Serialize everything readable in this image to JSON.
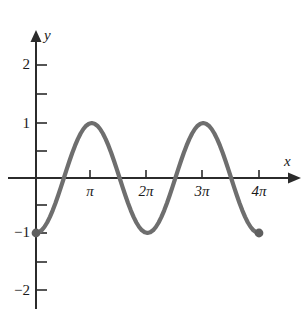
{
  "figure": {
    "background_color": "#ffffff",
    "axis_color": "#2b2b2b",
    "curve_color": "#6e6e6e",
    "text_color": "#1a1a1a"
  },
  "axes": {
    "x_axis_label": "x",
    "y_axis_label": "y",
    "x_tick_labels": [
      "π",
      "2π",
      "3π",
      "4π"
    ],
    "y_tick_labels": [
      "2",
      "1",
      "−1",
      "−2"
    ]
  },
  "chart_data": {
    "type": "line",
    "title": "",
    "xlabel": "x",
    "ylabel": "y",
    "grid": false,
    "legend": "none",
    "xlim": [
      -0.35,
      4.7
    ],
    "ylim": [
      -2.45,
      2.45
    ],
    "xticks": [
      3.14159,
      6.28319,
      9.42478,
      12.56637
    ],
    "xticklabels": [
      "π",
      "2π",
      "3π",
      "4π"
    ],
    "yticks": [
      2,
      1.5,
      1,
      0.5,
      -0.5,
      -1,
      -1.5,
      -2
    ],
    "yticklabels": [
      "2",
      "",
      "1",
      "",
      "",
      "−1",
      "",
      "−2"
    ],
    "series": [
      {
        "name": "y = −cos(x)",
        "color": "#6e6e6e",
        "x": [
          0.0,
          0.1571,
          0.3142,
          0.4712,
          0.6283,
          0.7854,
          0.9425,
          1.0996,
          1.2566,
          1.4137,
          1.5708,
          1.7279,
          1.885,
          2.042,
          2.1991,
          2.3562,
          2.5133,
          2.6704,
          2.8274,
          2.9845,
          3.1416,
          3.2987,
          3.4558,
          3.6128,
          3.7699,
          3.927,
          4.0841,
          4.2412,
          4.3982,
          4.5553,
          4.7124,
          4.8695,
          5.0265,
          5.1836,
          5.3407,
          5.4978,
          5.6549,
          5.8119,
          5.969,
          6.1261,
          6.2832,
          6.4403,
          6.5973,
          6.7544,
          6.9115,
          7.0686,
          7.2257,
          7.3827,
          7.5398,
          7.6969,
          7.854,
          8.0111,
          8.1681,
          8.3252,
          8.4823,
          8.6394,
          8.7965,
          8.9535,
          9.1106,
          9.2677,
          9.4248,
          9.5819,
          9.7389,
          9.896,
          10.0531,
          10.2102,
          10.3673,
          10.5243,
          10.6814,
          10.8385,
          10.9956,
          11.1527,
          11.3097,
          11.4668,
          11.6239,
          11.781,
          11.9381,
          12.0951,
          12.2522,
          12.4093,
          12.5664
        ],
        "y": [
          -1.0,
          -0.9877,
          -0.9511,
          -0.891,
          -0.809,
          -0.7071,
          -0.5878,
          -0.454,
          -0.309,
          -0.1564,
          0.0,
          0.1564,
          0.309,
          0.454,
          0.5878,
          0.7071,
          0.809,
          0.891,
          0.9511,
          0.9877,
          1.0,
          0.9877,
          0.9511,
          0.891,
          0.809,
          0.7071,
          0.5878,
          0.454,
          0.309,
          0.1564,
          0.0,
          -0.1564,
          -0.309,
          -0.454,
          -0.5878,
          -0.7071,
          -0.809,
          -0.891,
          -0.9511,
          -0.9877,
          -1.0,
          -0.9877,
          -0.9511,
          -0.891,
          -0.809,
          -0.7071,
          -0.5878,
          -0.454,
          -0.309,
          -0.1564,
          0.0,
          0.1564,
          0.309,
          0.454,
          0.5878,
          0.7071,
          0.809,
          0.891,
          0.9511,
          0.9877,
          1.0,
          0.9877,
          0.9511,
          0.891,
          0.809,
          0.7071,
          0.5878,
          0.454,
          0.309,
          0.1564,
          0.0,
          -0.1564,
          -0.309,
          -0.454,
          -0.5878,
          -0.7071,
          -0.809,
          -0.891,
          -0.9511,
          -0.9877,
          -1.0
        ]
      }
    ],
    "endpoints": [
      {
        "name": "start-point",
        "x": 0,
        "y": -1,
        "filled": true
      },
      {
        "name": "end-point",
        "x": 12.56637,
        "y": -1,
        "filled": true
      }
    ],
    "annotations": []
  }
}
